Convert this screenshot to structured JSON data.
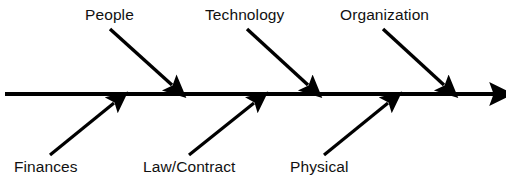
{
  "diagram": {
    "type": "fishbone-ishikawa",
    "title": "",
    "colors": {
      "background": "#ffffff",
      "line": "#000000",
      "text": "#111111"
    },
    "spine": {
      "name": "main-spine-arrow",
      "x1": 5,
      "y1": 94,
      "x2": 501,
      "y2": 94,
      "stroke_width": 4,
      "arrowhead": "right"
    },
    "categories_top": [
      {
        "id": "people",
        "label": "People",
        "label_x": 85,
        "label_y": 6,
        "arrow": {
          "x1": 110,
          "y1": 29,
          "x2": 177,
          "y2": 90
        }
      },
      {
        "id": "technology",
        "label": "Technology",
        "label_x": 205,
        "label_y": 6,
        "arrow": {
          "x1": 247,
          "y1": 29,
          "x2": 313,
          "y2": 90
        }
      },
      {
        "id": "organization",
        "label": "Organization",
        "label_x": 340,
        "label_y": 6,
        "arrow": {
          "x1": 383,
          "y1": 29,
          "x2": 449,
          "y2": 90
        }
      }
    ],
    "categories_bottom": [
      {
        "id": "finances",
        "label": "Finances",
        "label_x": 14,
        "label_y": 158,
        "arrow": {
          "x1": 50,
          "y1": 155,
          "x2": 119,
          "y2": 99
        }
      },
      {
        "id": "law-contract",
        "label": "Law/Contract",
        "label_x": 143,
        "label_y": 158,
        "arrow": {
          "x1": 189,
          "y1": 155,
          "x2": 259,
          "y2": 99
        }
      },
      {
        "id": "physical",
        "label": "Physical",
        "label_x": 290,
        "label_y": 158,
        "arrow": {
          "x1": 324,
          "y1": 155,
          "x2": 393,
          "y2": 99
        }
      }
    ]
  }
}
